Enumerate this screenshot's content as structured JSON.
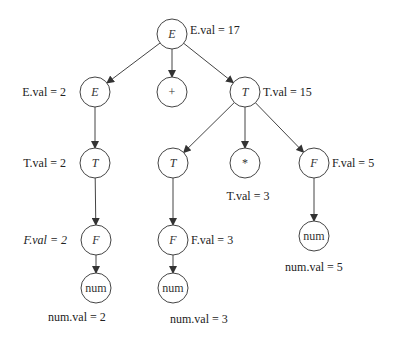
{
  "nodes": [
    {
      "id": "root-E",
      "symbol": "E",
      "italic": true,
      "label": "E.val = 17",
      "label_side": "right"
    },
    {
      "id": "E1",
      "symbol": "E",
      "italic": true,
      "label": "E.val = 2",
      "label_side": "left"
    },
    {
      "id": "plus",
      "symbol": "+",
      "italic": false,
      "label": "",
      "label_side": "none"
    },
    {
      "id": "T1",
      "symbol": "T",
      "italic": true,
      "label": "T.val = 15",
      "label_side": "right"
    },
    {
      "id": "T2",
      "symbol": "T",
      "italic": true,
      "label": "T.val = 2",
      "label_side": "left"
    },
    {
      "id": "T3",
      "symbol": "T",
      "italic": true,
      "label": "",
      "label_side": "none"
    },
    {
      "id": "star",
      "symbol": "*",
      "italic": false,
      "label": "T.val = 3",
      "label_side": "below"
    },
    {
      "id": "F3",
      "symbol": "F",
      "italic": true,
      "label": "F.val = 5",
      "label_side": "right"
    },
    {
      "id": "F1",
      "symbol": "F",
      "italic": true,
      "label": "F.val = 2",
      "label_side": "left",
      "label_italic": true
    },
    {
      "id": "F2",
      "symbol": "F",
      "italic": true,
      "label": "F.val = 3",
      "label_side": "right"
    },
    {
      "id": "num3",
      "symbol": "num",
      "italic": false,
      "label": "num.val = 5",
      "label_side": "below"
    },
    {
      "id": "num1",
      "symbol": "num",
      "italic": false,
      "label": "num.val = 2",
      "label_side": "below-left"
    },
    {
      "id": "num2",
      "symbol": "num",
      "italic": false,
      "label": "num.val = 3",
      "label_side": "below"
    }
  ],
  "edges": [
    [
      "root-E",
      "E1"
    ],
    [
      "root-E",
      "plus"
    ],
    [
      "root-E",
      "T1"
    ],
    [
      "E1",
      "T2"
    ],
    [
      "T1",
      "T3"
    ],
    [
      "T1",
      "star"
    ],
    [
      "T1",
      "F3"
    ],
    [
      "T2",
      "F1"
    ],
    [
      "T3",
      "F2"
    ],
    [
      "F3",
      "num3"
    ],
    [
      "F1",
      "num1"
    ],
    [
      "F2",
      "num2"
    ]
  ]
}
